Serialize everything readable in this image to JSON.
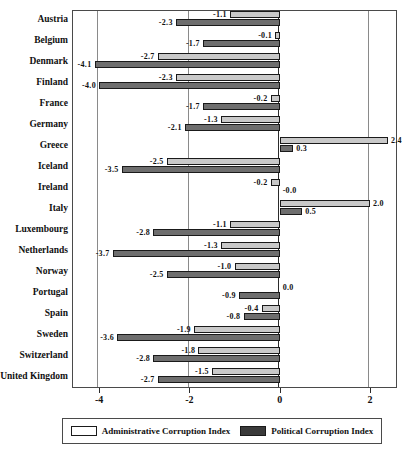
{
  "chart_data": {
    "type": "bar",
    "orientation": "horizontal",
    "title": "",
    "subtitle": "",
    "xlabel": "",
    "ylabel": "",
    "xlim": [
      -4.6,
      2.6
    ],
    "xticks": [
      -4,
      -2,
      0,
      2
    ],
    "xtick_labels": [
      "-4",
      "-2",
      "0",
      "2"
    ],
    "grid": true,
    "gridlines_at": [
      -4,
      -2,
      2
    ],
    "zero_axis": 0,
    "legend_position": "bottom",
    "categories": [
      "Austria",
      "Belgium",
      "Denmark",
      "Finland",
      "France",
      "Germany",
      "Greece",
      "Iceland",
      "Ireland",
      "Italy",
      "Luxembourg",
      "Netherlands",
      "Norway",
      "Portugal",
      "Spain",
      "Sweden",
      "Switzerland",
      "United Kingdom"
    ],
    "series": [
      {
        "name": "Administrative Corruption Index",
        "color": "#c9c9c9",
        "values": [
          -1.1,
          -0.1,
          -2.7,
          -2.3,
          -0.2,
          -1.3,
          2.4,
          -2.5,
          -0.2,
          2.0,
          -1.1,
          -1.3,
          -1.0,
          0.0,
          -0.4,
          -1.9,
          -1.8,
          -1.5
        ],
        "labels": [
          "-1.1",
          "-0.1",
          "-2.7",
          "-2.3",
          "-0.2",
          "-1.3",
          "2.4",
          "-2.5",
          "-0.2",
          "2.0",
          "-1.1",
          "-1.3",
          "-1.0",
          "0.0",
          "-0.4",
          "-1.9",
          "-1.8",
          "-1.5"
        ]
      },
      {
        "name": "Political Corruption Index",
        "color": "#6e6e6e",
        "values": [
          -2.3,
          -1.7,
          -4.1,
          -4.0,
          -1.7,
          -2.1,
          0.3,
          -3.5,
          -0.0,
          0.5,
          -2.8,
          -3.7,
          -2.5,
          -0.9,
          -0.8,
          -3.6,
          -2.8,
          -2.7
        ],
        "labels": [
          "-2.3",
          "-1.7",
          "-4.1",
          "-4.0",
          "-1.7",
          "-2.1",
          "0.3",
          "-3.5",
          "-0.0",
          "0.5",
          "-2.8",
          "-3.7",
          "-2.5",
          "-0.9",
          "-0.8",
          "-3.6",
          "-2.8",
          "-2.7"
        ]
      }
    ]
  },
  "legend": {
    "admin_label": "Administrative Corruption Index",
    "political_label": "Political Corruption Index"
  }
}
